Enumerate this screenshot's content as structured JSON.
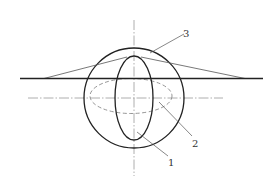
{
  "figure": {
    "colors": {
      "stroke": "#222222",
      "thin_stroke": "#555555",
      "center_line": "#999999",
      "dashed": "#888888",
      "background": "#ffffff"
    },
    "labels": [
      {
        "id": "1",
        "text": "1"
      },
      {
        "id": "2",
        "text": "2"
      },
      {
        "id": "3",
        "text": "3"
      }
    ]
  }
}
